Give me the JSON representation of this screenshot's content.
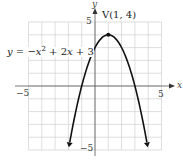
{
  "chart_data": {
    "type": "line",
    "title": "",
    "equation": "y = −x² + 2x + 3",
    "xlabel": "x",
    "ylabel": "y",
    "xlim": [
      -5,
      5
    ],
    "ylim": [
      -5,
      5
    ],
    "grid": true,
    "x_ticks_labeled": [
      "−5",
      "5"
    ],
    "y_ticks_labeled": [
      "5",
      "−5"
    ],
    "series": [
      {
        "name": "y = −x² + 2x + 3",
        "function": "-x^2 + 2x + 3",
        "x": [
          -2,
          -1,
          0,
          1,
          2,
          3,
          4
        ],
        "y": [
          -5,
          0,
          3,
          4,
          3,
          0,
          -5
        ],
        "arrows": "both ends (downward)"
      }
    ],
    "annotations": [
      {
        "text": "V(1, 4)",
        "x": 1,
        "y": 4,
        "marker": "point"
      },
      {
        "text": "y = −x² + 2x + 3",
        "position": "left of curve near y=3"
      }
    ]
  },
  "labels": {
    "x_axis": "x",
    "y_axis": "y",
    "x_min": "−5",
    "x_max": "5",
    "y_max": "5",
    "y_min": "−5",
    "vertex": "V(1, 4)",
    "eq_y": "y",
    "eq_eq": " = −",
    "eq_x1": "x",
    "eq_sq": "2",
    "eq_plus": " + 2",
    "eq_x2": "x",
    "eq_c": " + 3"
  }
}
